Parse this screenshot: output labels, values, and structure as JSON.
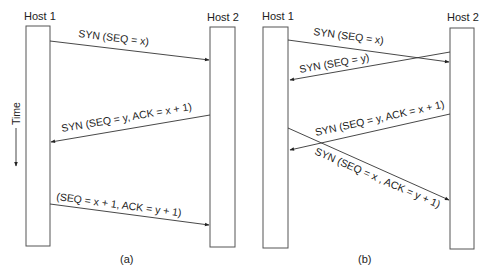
{
  "figure": {
    "time_label": "Time",
    "panels": [
      {
        "caption": "(a)",
        "host1": "Host 1",
        "host2": "Host 2",
        "messages": [
          {
            "label": "SYN (SEQ = x)",
            "direction": "host1-to-host2"
          },
          {
            "label": "SYN (SEQ = y, ACK = x + 1)",
            "direction": "host2-to-host1"
          },
          {
            "label": "(SEQ = x + 1, ACK = y + 1)",
            "direction": "host1-to-host2"
          }
        ]
      },
      {
        "caption": "(b)",
        "host1": "Host 1",
        "host2": "Host 2",
        "messages": [
          {
            "label": "SYN (SEQ = x)",
            "direction": "host1-to-host2"
          },
          {
            "label": "SYN (SEQ = y)",
            "direction": "host2-to-host1"
          },
          {
            "label": "SYN (SEQ = y, ACK = x + 1)",
            "direction": "host2-to-host1"
          },
          {
            "label": "SYN (SEQ = x , ACK = y + 1)",
            "direction": "host1-to-host2"
          }
        ]
      }
    ]
  }
}
